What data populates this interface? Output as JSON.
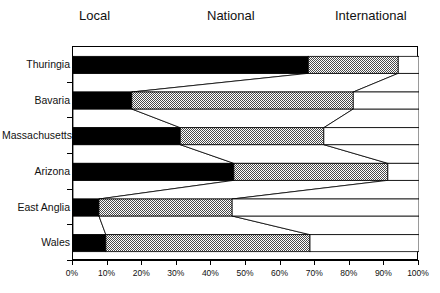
{
  "legend": {
    "items": [
      {
        "key": "local",
        "label": "Local",
        "fill": "#000000"
      },
      {
        "key": "national",
        "label": "National",
        "fill": "#a0a0a0"
      },
      {
        "key": "international",
        "label": "International",
        "fill": "#ffffff"
      }
    ]
  },
  "axis": {
    "x_ticks": [
      "0%",
      "10%",
      "20%",
      "30%",
      "40%",
      "50%",
      "60%",
      "70%",
      "80%",
      "90%",
      "100%"
    ],
    "x_min": 0,
    "x_max": 100
  },
  "chart_data": {
    "type": "bar",
    "title": "",
    "xlabel": "",
    "ylabel": "",
    "xlim": [
      0,
      100
    ],
    "grid": false,
    "stacked": true,
    "orientation": "horizontal",
    "legend_position": "top",
    "categories": [
      "Thuringia",
      "Bavaria",
      "Massachusetts",
      "Arizona",
      "East Anglia",
      "Wales"
    ],
    "series": [
      {
        "name": "Local",
        "fill": "#000000",
        "values": [
          68,
          17,
          31,
          46.5,
          7.5,
          9.5
        ]
      },
      {
        "name": "National",
        "fill": "#a0a0a0",
        "values": [
          26,
          64,
          41.5,
          44.5,
          38.5,
          59
        ]
      },
      {
        "name": "International",
        "fill": "#ffffff",
        "values": [
          6,
          19,
          27.5,
          9,
          54,
          31.5
        ]
      }
    ],
    "cumulative_boundaries": [
      {
        "category": "Thuringia",
        "local_end": 68,
        "national_end": 94
      },
      {
        "category": "Bavaria",
        "local_end": 17,
        "national_end": 81
      },
      {
        "category": "Massachusetts",
        "local_end": 31,
        "national_end": 72.5
      },
      {
        "category": "Arizona",
        "local_end": 46.5,
        "national_end": 91
      },
      {
        "category": "East Anglia",
        "local_end": 7.5,
        "national_end": 46
      },
      {
        "category": "Wales",
        "local_end": 9.5,
        "national_end": 68.5
      }
    ]
  }
}
